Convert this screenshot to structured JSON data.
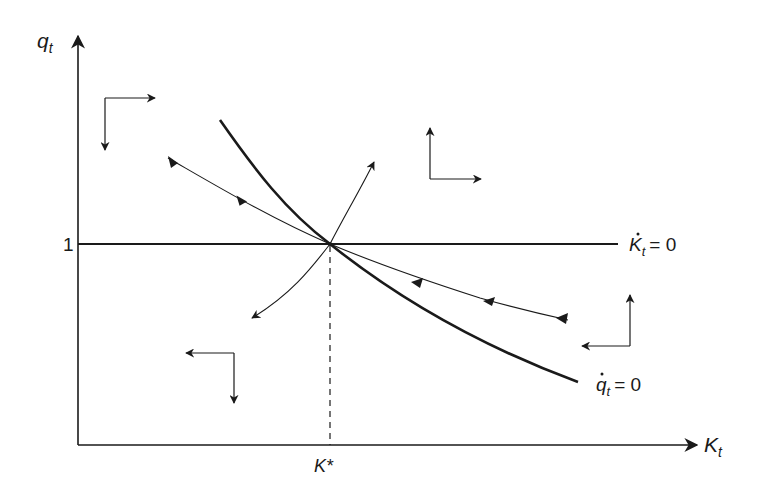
{
  "figure": {
    "type": "phase-diagram",
    "title": "",
    "axes": {
      "x_label_main": "K",
      "x_label_sub": "t",
      "y_label_main": "q",
      "y_label_sub": "t"
    },
    "ticks": {
      "y_one": "1",
      "x_kstar": "K*"
    },
    "loci": {
      "k_dot_label_main": "K",
      "k_dot_label_sub": "t",
      "k_dot_label_eq": "= 0",
      "q_dot_label_main": "q",
      "q_dot_label_sub": "t",
      "q_dot_label_eq": "= 0"
    },
    "direction_arrows": [
      {
        "region": "upper-left",
        "horizontal": "right",
        "vertical": "down"
      },
      {
        "region": "upper-right",
        "horizontal": "right",
        "vertical": "up"
      },
      {
        "region": "lower-left",
        "horizontal": "left",
        "vertical": "down"
      },
      {
        "region": "lower-right",
        "horizontal": "left",
        "vertical": "up"
      }
    ],
    "paths": {
      "stable_arm": "saddle path converging to steady state from upper-left and lower-right",
      "unstable_arm": "diverging path from lower-left to upper-right through steady state"
    },
    "colors": {
      "ink": "#1a1a1a",
      "background": "#ffffff"
    }
  }
}
